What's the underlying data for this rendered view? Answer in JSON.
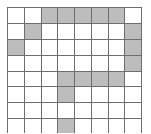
{
  "figure": {
    "title": "",
    "type": "grid-diagram",
    "rows": 8,
    "cols": 8,
    "colors": {
      "filled": "#bdbdbd",
      "empty": "#ffffff",
      "line": "#6e6e6e",
      "background": "#ffffff"
    }
  },
  "chart_data": {
    "type": "heatmap",
    "title": "",
    "xlabel": "",
    "ylabel": "",
    "categories": [
      "1",
      "2",
      "3",
      "4",
      "5",
      "6",
      "7",
      "8"
    ],
    "row_labels": [
      "1",
      "2",
      "3",
      "4",
      "5",
      "6",
      "7",
      "8"
    ],
    "legend": [],
    "grid": true,
    "values": [
      [
        0,
        0,
        1,
        1,
        1,
        1,
        1,
        0
      ],
      [
        0,
        1,
        0,
        0,
        0,
        0,
        0,
        1
      ],
      [
        1,
        0,
        0,
        0,
        0,
        0,
        0,
        1
      ],
      [
        0,
        0,
        0,
        0,
        0,
        0,
        0,
        1
      ],
      [
        0,
        0,
        0,
        1,
        1,
        1,
        1,
        0
      ],
      [
        0,
        0,
        0,
        1,
        0,
        0,
        0,
        0
      ],
      [
        0,
        0,
        0,
        0,
        0,
        0,
        0,
        0
      ],
      [
        0,
        0,
        0,
        1,
        0,
        0,
        0,
        0
      ]
    ]
  }
}
